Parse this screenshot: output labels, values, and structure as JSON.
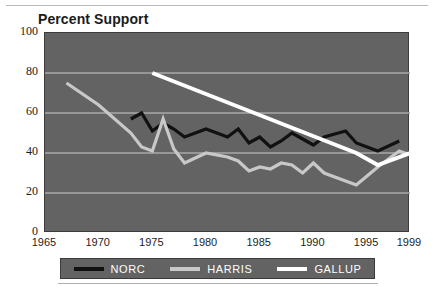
{
  "chart_title": "Percent Support",
  "axes": {
    "y_ticks": [
      "0",
      "20",
      "40",
      "60",
      "80",
      "100"
    ],
    "x_ticks": [
      "1965",
      "1970",
      "1975",
      "1980",
      "1985",
      "1990",
      "1995",
      "1999"
    ]
  },
  "legend": {
    "items": [
      {
        "label": "NORC",
        "color": "#111111"
      },
      {
        "label": "HARRIS",
        "color": "#c8c8c8"
      },
      {
        "label": "GALLUP",
        "color": "#ffffff"
      }
    ]
  },
  "colors": {
    "plot_background": "#636363",
    "gridline": "#a8a8a8",
    "norc": "#111111",
    "harris": "#c8c8c8",
    "gallup": "#ffffff",
    "text": "#1d1d1d"
  },
  "chart_data": {
    "type": "line",
    "title": "Percent Support",
    "xlabel": "",
    "ylabel": "Percent Support",
    "xlim": [
      1965,
      1999
    ],
    "ylim": [
      0,
      100
    ],
    "grid": true,
    "legend_position": "bottom",
    "y_ticks": [
      0,
      20,
      40,
      60,
      80,
      100
    ],
    "x_ticks": [
      1965,
      1970,
      1975,
      1980,
      1985,
      1990,
      1995,
      1999
    ],
    "series": [
      {
        "name": "NORC",
        "color": "#111111",
        "x": [
          1973,
          1974,
          1975,
          1976,
          1977,
          1978,
          1980,
          1982,
          1983,
          1984,
          1985,
          1986,
          1987,
          1988,
          1989,
          1990,
          1991,
          1993,
          1994,
          1996,
          1998
        ],
        "values": [
          57,
          60,
          51,
          55,
          52,
          48,
          52,
          48,
          52,
          45,
          48,
          43,
          46,
          50,
          47,
          44,
          48,
          51,
          45,
          41,
          46
        ]
      },
      {
        "name": "HARRIS",
        "color": "#c8c8c8",
        "x": [
          1967,
          1970,
          1973,
          1974,
          1975,
          1976,
          1977,
          1978,
          1980,
          1982,
          1983,
          1984,
          1985,
          1986,
          1987,
          1988,
          1989,
          1990,
          1991,
          1993,
          1994,
          1996,
          1998,
          1999
        ],
        "values": [
          75,
          64,
          50,
          43,
          41,
          57,
          42,
          35,
          40,
          38,
          36,
          31,
          33,
          32,
          35,
          34,
          30,
          35,
          30,
          26,
          24,
          33,
          41,
          39
        ]
      },
      {
        "name": "GALLUP",
        "color": "#ffffff",
        "x": [
          1975,
          1994,
          1996,
          1999
        ],
        "values": [
          80,
          40,
          34,
          40
        ]
      }
    ]
  }
}
